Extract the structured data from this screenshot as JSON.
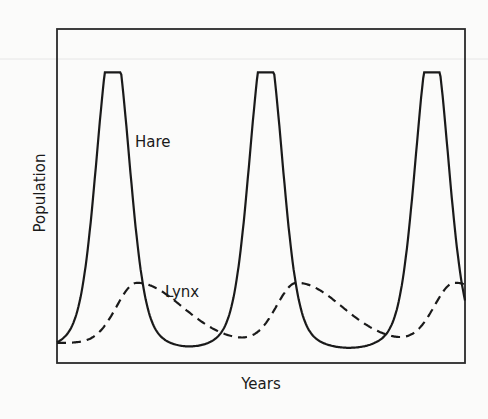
{
  "chart_data": {
    "type": "line",
    "title": "",
    "xlabel": "Years",
    "ylabel": "Population",
    "grid": false,
    "legend": "inline labels",
    "x_ticks": [],
    "y_ticks": [],
    "x": [
      0,
      0.5,
      1,
      1.5,
      2,
      2.5,
      3,
      3.5,
      4,
      4.5,
      5,
      5.5,
      6,
      6.5,
      7,
      7.5,
      8,
      8.5,
      9,
      9.5,
      10
    ],
    "series": [
      {
        "name": "Hare",
        "style": "solid",
        "annotation": "Hare",
        "peaks_x_fraction": [
          0.137,
          0.512,
          0.919
        ],
        "peak_value": 0.87,
        "min_value": 0.04,
        "start_value": 0.08,
        "end_value": 0.15
      },
      {
        "name": "Lynx",
        "style": "dashed",
        "annotation": "Lynx",
        "peaks_x_fraction": [
          0.196,
          0.588,
          0.975
        ],
        "peak_value": 0.24,
        "min_value": 0.06,
        "start_value": 0.07
      }
    ]
  },
  "labels": {
    "x_axis": "Years",
    "y_axis": "Population",
    "hare": "Hare",
    "lynx": "Lynx"
  },
  "colors": {
    "background": "#fbfbfa",
    "line": "#1a1a1a",
    "axis": "#2a2a2a"
  }
}
